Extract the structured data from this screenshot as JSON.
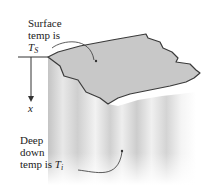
{
  "labels": {
    "surface_line1": "Surface",
    "surface_line2": "temp is",
    "surface_symbol": "T",
    "surface_subscript": "S",
    "axis_label": "x",
    "deep_line1": "Deep",
    "deep_line2": "down",
    "deep_line3": "temp is ",
    "deep_symbol": "T",
    "deep_subscript": "i"
  },
  "colors": {
    "surface_fill": "#c8c8c8",
    "outline": "#3a3a3a",
    "body_shade": "#d4d4d4"
  }
}
